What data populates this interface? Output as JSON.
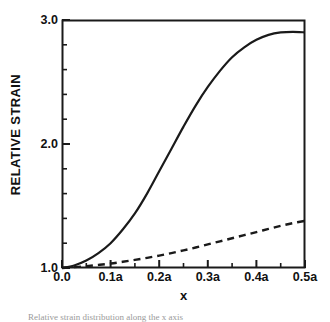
{
  "figure": {
    "background_color": "#ffffff",
    "ink_color": "#1a1a1a",
    "caption_text": "Relative strain distribution along the x axis"
  },
  "chart_data": {
    "type": "line",
    "title": "",
    "xlabel": "x",
    "ylabel": "RELATIVE STRAIN",
    "xlim": [
      0.0,
      0.5
    ],
    "ylim": [
      1.0,
      3.0
    ],
    "grid": false,
    "legend_position": "none",
    "x_major_ticks": [
      0.0,
      0.1,
      0.2,
      0.3,
      0.4,
      0.5
    ],
    "x_tick_labels": [
      "0.0",
      "0.1a",
      "0.2a",
      "0.3a",
      "0.4a",
      "0.5a"
    ],
    "x_minor_step": 0.05,
    "y_major_ticks": [
      1.0,
      2.0,
      3.0
    ],
    "y_tick_labels": [
      "1.0",
      "2.0",
      "3.0"
    ],
    "y_minor_step": 0.2,
    "series": [
      {
        "name": "solid-curve",
        "style": "solid",
        "color": "#1a1a1a",
        "x": [
          0.0,
          0.025,
          0.05,
          0.075,
          0.1,
          0.125,
          0.15,
          0.175,
          0.2,
          0.225,
          0.25,
          0.275,
          0.3,
          0.325,
          0.35,
          0.375,
          0.4,
          0.425,
          0.45,
          0.475,
          0.5
        ],
        "values": [
          1.0,
          1.02,
          1.06,
          1.12,
          1.2,
          1.31,
          1.44,
          1.6,
          1.78,
          1.96,
          2.14,
          2.31,
          2.46,
          2.59,
          2.7,
          2.78,
          2.84,
          2.88,
          2.9,
          2.905,
          2.9
        ]
      },
      {
        "name": "dashed-curve",
        "style": "dashed",
        "color": "#1a1a1a",
        "x": [
          0.0,
          0.025,
          0.05,
          0.075,
          0.1,
          0.125,
          0.15,
          0.175,
          0.2,
          0.225,
          0.25,
          0.275,
          0.3,
          0.325,
          0.35,
          0.375,
          0.4,
          0.425,
          0.45,
          0.475,
          0.5
        ],
        "values": [
          1.0,
          1.007,
          1.015,
          1.025,
          1.036,
          1.05,
          1.065,
          1.082,
          1.1,
          1.12,
          1.142,
          1.165,
          1.19,
          1.215,
          1.24,
          1.265,
          1.29,
          1.315,
          1.34,
          1.362,
          1.38
        ]
      }
    ]
  },
  "plot_area": {
    "left_px": 62,
    "top_px": 20,
    "right_px": 305,
    "bottom_px": 268
  }
}
